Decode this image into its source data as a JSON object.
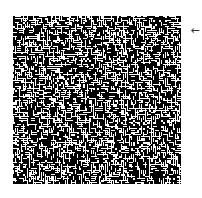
{
  "figure": {
    "type": "random-binary-noise-texture",
    "size_px": 168,
    "cell_px": 2,
    "foreground_color": "#ffffff",
    "background_color": "#000000",
    "white_fraction": 0.42,
    "seed": 20240517
  },
  "marker": {
    "icon": "left-arrow-icon",
    "glyph": "←",
    "color": "#333333"
  }
}
